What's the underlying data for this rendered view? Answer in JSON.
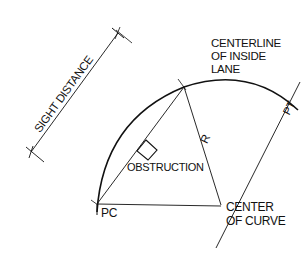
{
  "diagram": {
    "labels": {
      "sight_distance": "SIGHT DISTANCE",
      "centerline_line1": "CENTERLINE",
      "centerline_line2": "OF INSIDE",
      "centerline_line3": "LANE",
      "radius": "R",
      "obstruction": "OBSTRUCTION",
      "pc": "PC",
      "pt": "PT",
      "center_line1": "CENTER",
      "center_line2": "OF CURVE"
    },
    "colors": {
      "stroke": "#111111",
      "background": "#ffffff"
    }
  }
}
